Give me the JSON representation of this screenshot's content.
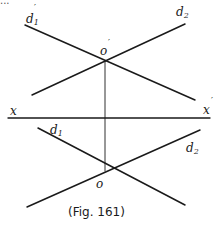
{
  "figure": {
    "caption": "(Fig. 161)",
    "top_text_fragment": "...",
    "colors": {
      "ink": "#1a1a1a",
      "background": "#ffffff"
    }
  },
  "labels": {
    "d1_prime": {
      "base": "d",
      "sub": "1",
      "prime": "′"
    },
    "d2_prime": {
      "base": "d",
      "sub": "2",
      "prime": ""
    },
    "o_prime": {
      "base": "o",
      "prime": "′"
    },
    "x": {
      "base": "x"
    },
    "x_prime": {
      "base": "x",
      "prime": "′"
    },
    "d1": {
      "base": "d",
      "sub": "1"
    },
    "d2": {
      "base": "d",
      "sub": "2"
    },
    "o": {
      "base": "o"
    }
  },
  "geometry": {
    "ground_line": {
      "x1": 8,
      "y1": 118,
      "x2": 210,
      "y2": 118
    },
    "projector": {
      "x1": 105,
      "y1": 61,
      "x2": 105,
      "y2": 171
    },
    "upper_d1": {
      "x1": 25,
      "y1": 25,
      "x2": 195,
      "y2": 100
    },
    "upper_d2": {
      "x1": 185,
      "y1": 24,
      "x2": 32,
      "y2": 95
    },
    "lower_d1": {
      "x1": 38,
      "y1": 128,
      "x2": 185,
      "y2": 205
    },
    "lower_d2": {
      "x1": 200,
      "y1": 130,
      "x2": 27,
      "y2": 207
    },
    "o_prime_point": {
      "x": 105,
      "y": 61
    },
    "o_point": {
      "x": 105,
      "y": 171
    }
  }
}
